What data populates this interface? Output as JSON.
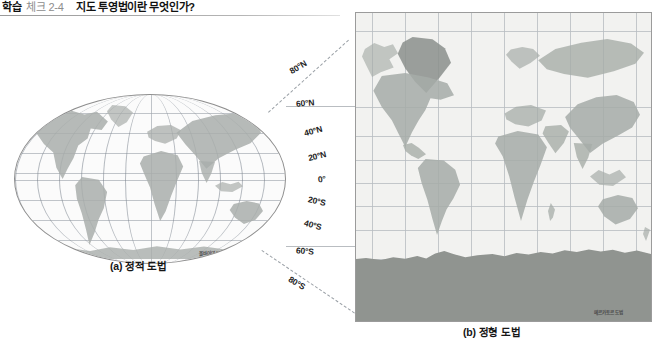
{
  "header": {
    "label": "학습",
    "number": "체크 2-4",
    "title": "지도 투영법이란 무엇인가?"
  },
  "figure": {
    "maps": [
      {
        "id": "map-a",
        "caption": "(a) 정적 도법",
        "projection_credit": "몰바이데 도법",
        "shape": "oval"
      },
      {
        "id": "map-b",
        "caption": "(b) 정형 도법",
        "projection_credit": "메르카토르 도법",
        "shape": "rectangle"
      }
    ],
    "latitude_labels": [
      {
        "text": "80°N",
        "y": 12,
        "x": 1,
        "rot": -31
      },
      {
        "text": "60°N",
        "y": 48,
        "x": 8,
        "rot": -4
      },
      {
        "text": "40°N",
        "y": 76,
        "x": 16,
        "rot": -15
      },
      {
        "text": "20°N",
        "y": 101,
        "x": 20,
        "rot": -13
      },
      {
        "text": "0°",
        "y": 124,
        "x": 30,
        "rot": -6
      },
      {
        "text": "20°S",
        "y": 146,
        "x": 20,
        "rot": 13
      },
      {
        "text": "40°S",
        "y": 170,
        "x": 16,
        "rot": 15
      },
      {
        "text": "60°S",
        "y": 196,
        "x": 8,
        "rot": 5
      },
      {
        "text": "80°S",
        "y": 228,
        "x": 0,
        "rot": 31
      }
    ],
    "colors": {
      "land": "#a9aeab",
      "ocean": "#fbfbfb",
      "antarctica": "#909490",
      "graticule": "#9fa6ad",
      "border": "#8e8e8e"
    }
  }
}
